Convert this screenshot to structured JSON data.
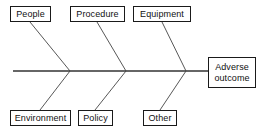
{
  "diagram": {
    "type": "fishbone-ishikawa-cause-and-effect",
    "title": "",
    "colors": {
      "line": "#333333",
      "box_border": "#1a1a1a",
      "text": "#111111",
      "background": "#ffffff"
    },
    "spine": {
      "label": "spine",
      "x1": 13,
      "y1": 71,
      "x2": 208,
      "y2": 71
    },
    "effect": {
      "label_line1": "Adverse",
      "label_line2": "outcome"
    },
    "causes_top": [
      {
        "label": "People",
        "box": [
          10,
          6,
          41,
          16
        ],
        "joint_x": 70
      },
      {
        "label": "Procedure",
        "box": [
          70,
          6,
          55,
          16
        ],
        "joint_x": 126
      },
      {
        "label": "Equipment",
        "box": [
          133,
          6,
          58,
          16
        ],
        "joint_x": 186
      }
    ],
    "causes_bottom": [
      {
        "label": "Environment",
        "box": [
          10,
          110,
          61,
          16
        ],
        "joint_x": 70
      },
      {
        "label": "Policy",
        "box": [
          78,
          110,
          35,
          16
        ],
        "joint_x": 126
      },
      {
        "label": "Other",
        "box": [
          143,
          110,
          34,
          16
        ],
        "joint_x": 186
      }
    ],
    "ribs": [
      {
        "name": "rib-people",
        "x1": 30,
        "y1": 22,
        "x2": 70,
        "y2": 71
      },
      {
        "name": "rib-procedure",
        "x1": 97,
        "y1": 22,
        "x2": 126,
        "y2": 71
      },
      {
        "name": "rib-equipment",
        "x1": 162,
        "y1": 22,
        "x2": 186,
        "y2": 71
      },
      {
        "name": "rib-environment",
        "x1": 40,
        "y1": 110,
        "x2": 70,
        "y2": 71
      },
      {
        "name": "rib-policy",
        "x1": 95,
        "y1": 110,
        "x2": 126,
        "y2": 71
      },
      {
        "name": "rib-other",
        "x1": 160,
        "y1": 110,
        "x2": 186,
        "y2": 71
      }
    ]
  }
}
